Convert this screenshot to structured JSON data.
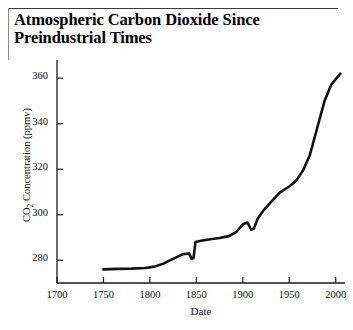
{
  "figure": {
    "title_line1": "Atmospheric Carbon Dioxide Since",
    "title_line2": "Preindustrial Times",
    "line_color": "#111111",
    "axis_color": "#1a1a1a",
    "background": "#fefefe"
  },
  "chart_data": {
    "type": "line",
    "title": "Atmospheric Carbon Dioxide Since Preindustrial Times",
    "xlabel": "Date",
    "ylabel": "CO2 Concentration (ppmv)",
    "ylabel_rich": "CO₂ Concentration (ppmv)",
    "xlim": [
      1700,
      2010
    ],
    "ylim": [
      270,
      368
    ],
    "xticks": [
      1700,
      1750,
      1800,
      1850,
      1900,
      1950,
      2000
    ],
    "xticklabels": [
      "1700",
      "1750",
      "1800",
      "1850",
      "1900",
      "1950",
      "2000"
    ],
    "yticks": [
      280,
      300,
      320,
      340,
      360
    ],
    "yticklabels": [
      "280",
      "300",
      "320",
      "340",
      "360"
    ],
    "grid": false,
    "legend": false,
    "series": [
      {
        "name": "Atmospheric CO2",
        "x": [
          1750,
          1765,
          1780,
          1795,
          1805,
          1815,
          1825,
          1835,
          1842,
          1845,
          1847,
          1849,
          1855,
          1865,
          1875,
          1885,
          1893,
          1900,
          1905,
          1909,
          1912,
          1916,
          1922,
          1930,
          1940,
          1950,
          1958,
          1965,
          1972,
          1980,
          1988,
          1995,
          2000,
          2005
        ],
        "y": [
          276.0,
          276.2,
          276.3,
          276.6,
          277.2,
          278.6,
          280.6,
          282.6,
          283.0,
          280.6,
          281.0,
          288.0,
          288.6,
          289.2,
          289.8,
          290.6,
          292.4,
          295.8,
          296.6,
          293.4,
          294.0,
          298.2,
          301.8,
          305.4,
          309.8,
          312.4,
          315.2,
          319.6,
          326.0,
          338.0,
          350.0,
          357.0,
          359.6,
          362.0
        ]
      }
    ]
  },
  "axis_labels": {
    "y": [
      "360",
      "340",
      "320",
      "300",
      "280"
    ],
    "x": [
      "1700",
      "1750",
      "1800",
      "1850",
      "1900",
      "1950",
      "2000"
    ]
  }
}
